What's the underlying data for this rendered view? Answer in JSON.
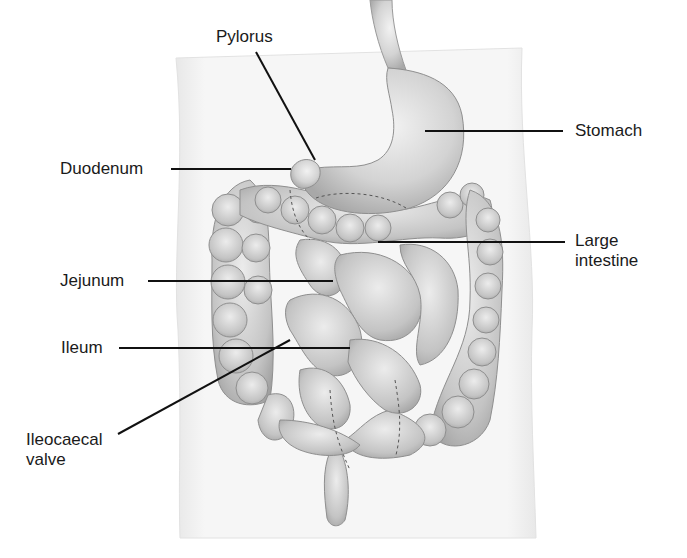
{
  "diagram": {
    "labels": [
      {
        "id": "pylorus",
        "text": "Pylorus"
      },
      {
        "id": "stomach",
        "text": "Stomach"
      },
      {
        "id": "duodenum",
        "text": "Duodenum"
      },
      {
        "id": "large_intestine_l1",
        "text": "Large"
      },
      {
        "id": "large_intestine_l2",
        "text": "intestine"
      },
      {
        "id": "jejunum",
        "text": "Jejunum"
      },
      {
        "id": "ileum",
        "text": "Ileum"
      },
      {
        "id": "ileocaecal_l1",
        "text": "Ileocaecal"
      },
      {
        "id": "ileocaecal_l2",
        "text": "valve"
      }
    ],
    "colors": {
      "background": "#ffffff",
      "torso": "#f4f4f4",
      "organ": "#c9c9c9",
      "organ_shade": "#9a9a9a",
      "leader_line": "#111111",
      "text": "#1a1a1a"
    }
  }
}
